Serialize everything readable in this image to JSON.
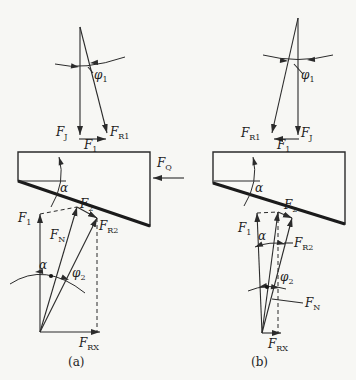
{
  "colors": {
    "ink": "#2b2b2b",
    "paper": "#f7f7f4"
  },
  "captions": {
    "a": "(a)",
    "b": "(b)"
  },
  "labels": {
    "phi1": {
      "main": "φ",
      "sub": "1"
    },
    "phi2": {
      "main": "φ",
      "sub": "2"
    },
    "alpha": {
      "main": "α",
      "sub": ""
    },
    "FJ": {
      "main": "F",
      "sub": "J"
    },
    "F1": {
      "main": "F",
      "sub": "1"
    },
    "F2": {
      "main": "F",
      "sub": "2"
    },
    "FR1": {
      "main": "F",
      "sub": "R1"
    },
    "FR2": {
      "main": "F",
      "sub": "R2"
    },
    "FQ": {
      "main": "F",
      "sub": "Q"
    },
    "FN": {
      "main": "F",
      "sub": "N"
    },
    "FRX": {
      "main": "F",
      "sub": "RX"
    }
  }
}
